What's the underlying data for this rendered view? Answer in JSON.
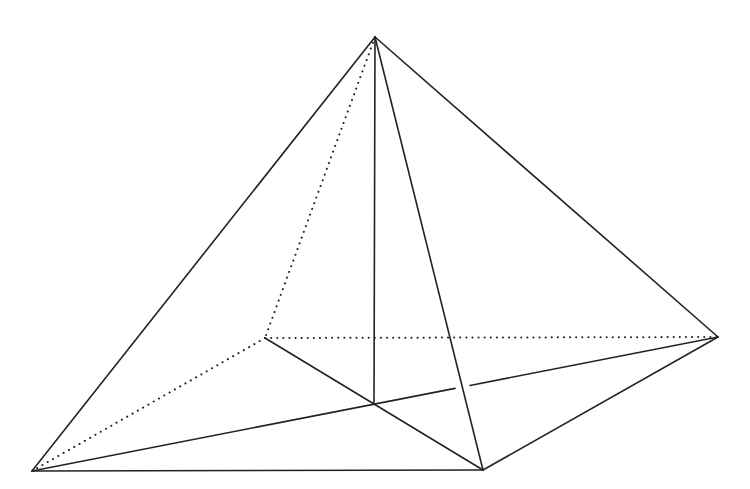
{
  "diagram": {
    "type": "pyramid-wireframe",
    "stroke_color": "#222222",
    "background": "#ffffff",
    "vertices": {
      "apex": [
        375,
        37
      ],
      "left": [
        32,
        471
      ],
      "bottom": [
        483,
        470
      ],
      "right": [
        718,
        337
      ],
      "back": [
        265,
        338
      ],
      "center": [
        374,
        404
      ]
    },
    "solid_edges": [
      [
        "apex",
        "left"
      ],
      [
        "apex",
        "right"
      ],
      [
        "apex",
        "bottom"
      ],
      [
        "apex",
        "center"
      ],
      [
        "left",
        "bottom"
      ],
      [
        "bottom",
        "right"
      ],
      [
        "back",
        "center"
      ],
      [
        "center",
        "bottom"
      ]
    ],
    "dotted_edges": [
      [
        "apex",
        "back"
      ],
      [
        "back",
        "right"
      ],
      [
        "back",
        "left"
      ]
    ],
    "broken_edges": [
      {
        "from": "left",
        "to": "right",
        "gap_x": [
          455,
          470
        ]
      }
    ]
  }
}
